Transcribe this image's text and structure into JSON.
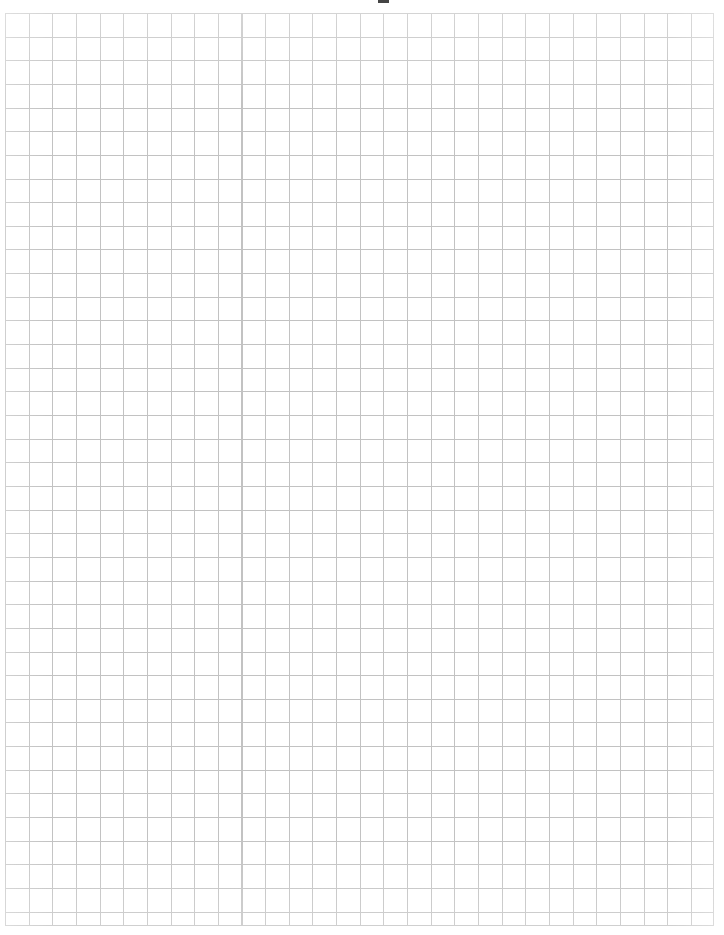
{
  "document": {
    "type": "graph-paper",
    "title": "Blank Quad-Ruled Graph Paper",
    "page_width_px": 724,
    "page_height_px": 935,
    "background_color": "#ffffff",
    "has_text_content": false,
    "caption": ""
  },
  "grid": {
    "name": "quad-ruled-grid",
    "left_px": 5,
    "top_px": 13,
    "width_px": 709,
    "height_px": 913,
    "cell_size_px": 23.65,
    "columns": 30,
    "rows": 38.6,
    "line_color": "#c2c2c2",
    "line_weight_px": 1,
    "border_color": "#c2c2c2",
    "emphasized_lines": false,
    "label": ""
  },
  "margins": {
    "top_px": 13,
    "left_px": 5,
    "right_px": 10,
    "bottom_px": 9,
    "color": "#ffffff"
  },
  "artifacts": {
    "scan_mark": {
      "name": "scan-artifact",
      "left_px": 378,
      "top_px": 0,
      "width_px": 11,
      "height_px": 3,
      "color": "#2b2b2b",
      "description": ""
    }
  }
}
